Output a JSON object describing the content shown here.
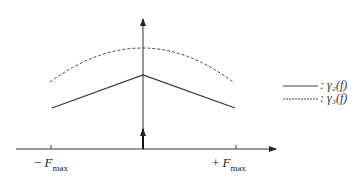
{
  "diagram": {
    "type": "spectral_plot",
    "x_axis": {
      "ticks": [
        {
          "sign": "−",
          "symbol": "F",
          "sub": "max"
        },
        {
          "sign": "+",
          "symbol": "F",
          "sub": "max"
        }
      ]
    },
    "legend": [
      {
        "style": "solid",
        "label": ": γ₂(f)"
      },
      {
        "style": "dashed",
        "label": ": γ₃(f)"
      }
    ],
    "curves": [
      {
        "name": "gamma2",
        "style": "solid",
        "shape": "triangle",
        "points": [
          [
            52,
            108
          ],
          [
            143,
            75
          ],
          [
            235,
            108
          ]
        ]
      },
      {
        "name": "gamma3",
        "style": "dashed",
        "shape": "arc",
        "points": [
          [
            50,
            82
          ],
          [
            143,
            48
          ],
          [
            233,
            82
          ]
        ]
      }
    ],
    "dirac_at_origin": true
  }
}
